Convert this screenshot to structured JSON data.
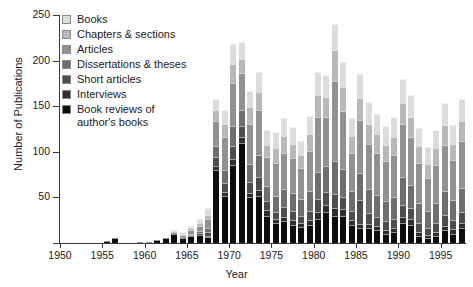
{
  "chart_data": {
    "type": "bar",
    "subtype": "stacked-vertical",
    "title": "",
    "xlabel": "Year",
    "ylabel": "Number of Publications",
    "ylim": [
      0,
      250
    ],
    "yticks": [
      0,
      50,
      100,
      150,
      200,
      250
    ],
    "ytick_labels": [
      "",
      "50",
      "100",
      "150",
      "200",
      "250"
    ],
    "xlim": [
      1950,
      1998
    ],
    "xticks": [
      1950,
      1955,
      1960,
      1965,
      1970,
      1975,
      1980,
      1985,
      1990,
      1995
    ],
    "xtick_labels": [
      "1950",
      "1955",
      "1960",
      "1965",
      "1970",
      "1975",
      "1980",
      "1985",
      "1990",
      "1995"
    ],
    "grid": false,
    "legend_position": "top-left",
    "categories": [
      1951,
      1952,
      1953,
      1954,
      1955,
      1956,
      1957,
      1958,
      1959,
      1960,
      1961,
      1962,
      1963,
      1964,
      1965,
      1966,
      1967,
      1968,
      1969,
      1970,
      1971,
      1972,
      1973,
      1974,
      1975,
      1976,
      1977,
      1978,
      1979,
      1980,
      1981,
      1982,
      1983,
      1984,
      1985,
      1986,
      1987,
      1988,
      1989,
      1990,
      1991,
      1992,
      1993,
      1994,
      1995,
      1996,
      1997
    ],
    "series": [
      {
        "name": "Book reviews of author's books",
        "color": "#0d0d0d",
        "values": [
          0,
          0,
          0,
          0,
          2,
          6,
          0,
          0,
          1,
          1,
          3,
          5,
          10,
          6,
          8,
          9,
          7,
          80,
          52,
          86,
          110,
          50,
          52,
          30,
          22,
          24,
          20,
          18,
          20,
          26,
          34,
          30,
          30,
          20,
          16,
          16,
          14,
          10,
          12,
          22,
          20,
          8,
          6,
          8,
          14,
          10,
          16
        ]
      },
      {
        "name": "Interviews",
        "color": "#2e2e2e",
        "values": [
          0,
          0,
          0,
          0,
          0,
          0,
          0,
          0,
          0,
          0,
          0,
          0,
          0,
          0,
          0,
          0,
          1,
          4,
          4,
          6,
          6,
          5,
          6,
          6,
          4,
          5,
          5,
          4,
          5,
          8,
          8,
          8,
          7,
          5,
          5,
          5,
          5,
          4,
          4,
          6,
          6,
          4,
          3,
          4,
          5,
          5,
          6
        ]
      },
      {
        "name": "Short articles",
        "color": "#4d4d4d",
        "values": [
          0,
          0,
          0,
          0,
          0,
          0,
          0,
          0,
          0,
          0,
          0,
          0,
          0,
          1,
          1,
          2,
          4,
          10,
          10,
          14,
          12,
          12,
          14,
          10,
          8,
          10,
          10,
          8,
          10,
          14,
          14,
          16,
          14,
          10,
          26,
          12,
          10,
          10,
          10,
          14,
          12,
          10,
          8,
          10,
          12,
          10,
          12
        ]
      },
      {
        "name": "Dissertations & theses",
        "color": "#6e6e6e",
        "values": [
          0,
          0,
          0,
          0,
          0,
          0,
          0,
          0,
          0,
          0,
          0,
          0,
          0,
          0,
          1,
          2,
          4,
          12,
          14,
          22,
          18,
          20,
          24,
          16,
          18,
          20,
          20,
          18,
          22,
          30,
          28,
          36,
          30,
          22,
          30,
          26,
          24,
          22,
          24,
          30,
          26,
          22,
          18,
          22,
          26,
          22,
          26
        ]
      },
      {
        "name": "Articles",
        "color": "#919191",
        "values": [
          0,
          0,
          0,
          0,
          0,
          0,
          0,
          0,
          0,
          0,
          0,
          0,
          2,
          2,
          4,
          6,
          10,
          28,
          36,
          48,
          40,
          44,
          50,
          32,
          36,
          40,
          38,
          34,
          44,
          60,
          54,
          88,
          64,
          42,
          58,
          50,
          46,
          44,
          46,
          58,
          52,
          44,
          36,
          42,
          50,
          44,
          52
        ]
      },
      {
        "name": "Chapters & sections",
        "color": "#b8b8b8",
        "values": [
          0,
          0,
          0,
          0,
          0,
          0,
          0,
          0,
          0,
          0,
          0,
          0,
          1,
          1,
          2,
          3,
          5,
          12,
          14,
          20,
          16,
          18,
          20,
          14,
          16,
          18,
          16,
          14,
          18,
          24,
          22,
          34,
          26,
          18,
          24,
          22,
          20,
          18,
          20,
          24,
          22,
          18,
          16,
          18,
          22,
          18,
          22
        ]
      },
      {
        "name": "Books",
        "color": "#dcdcdc",
        "values": [
          0,
          0,
          0,
          0,
          0,
          0,
          0,
          0,
          0,
          0,
          0,
          0,
          1,
          2,
          3,
          4,
          7,
          12,
          16,
          22,
          18,
          18,
          22,
          16,
          18,
          20,
          18,
          16,
          20,
          26,
          24,
          28,
          28,
          20,
          26,
          24,
          22,
          20,
          22,
          26,
          24,
          20,
          18,
          20,
          24,
          20,
          24
        ]
      }
    ],
    "legend_entries": [
      {
        "label": "Books",
        "color": "#dcdcdc"
      },
      {
        "label": "Chapters & sections",
        "color": "#b8b8b8"
      },
      {
        "label": "Articles",
        "color": "#919191"
      },
      {
        "label": "Dissertations & theses",
        "color": "#6e6e6e"
      },
      {
        "label": "Short articles",
        "color": "#4d4d4d"
      },
      {
        "label": "Interviews",
        "color": "#2e2e2e"
      },
      {
        "label": "Book reviews of\nauthor's books",
        "color": "#0d0d0d"
      }
    ]
  }
}
